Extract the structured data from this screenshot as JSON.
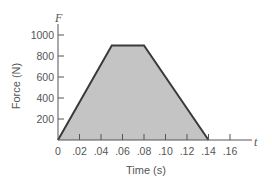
{
  "chart_data": {
    "type": "area",
    "title": "",
    "xlabel": "Time (s)",
    "ylabel": "Force (N)",
    "x_axis_var": "t",
    "y_axis_var": "F",
    "xlim": [
      0,
      0.17
    ],
    "ylim": [
      0,
      1050
    ],
    "x_ticks": [
      0,
      0.02,
      0.04,
      0.06,
      0.08,
      0.1,
      0.12,
      0.14,
      0.16
    ],
    "x_tick_labels": [
      "0",
      ".02",
      ".04",
      ".06",
      ".08",
      ".10",
      ".12",
      ".14",
      ".16"
    ],
    "y_ticks": [
      200,
      400,
      600,
      800,
      1000
    ],
    "y_tick_labels": [
      "200",
      "400",
      "600",
      "800",
      "1000"
    ],
    "grid": false,
    "legend": null,
    "series": [
      {
        "name": "Force",
        "x": [
          0,
          0.05,
          0.08,
          0.14
        ],
        "y": [
          0,
          900,
          900,
          0
        ],
        "fill_color": "#c4c4c4",
        "line_color": "#3a3a3a"
      }
    ]
  }
}
